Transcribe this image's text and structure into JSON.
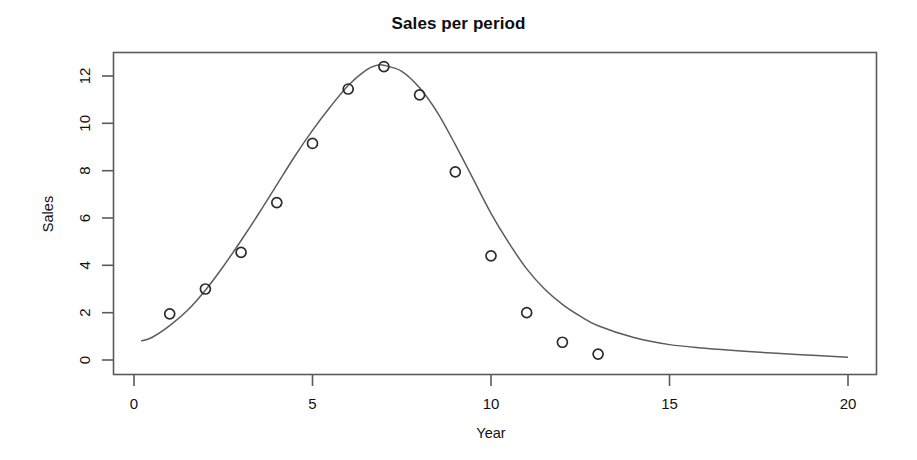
{
  "chart_data": {
    "type": "scatter",
    "title": "Sales per period",
    "xlabel": "Year",
    "ylabel": "Sales",
    "xlim": [
      0,
      20
    ],
    "ylim": [
      0,
      13
    ],
    "grid": false,
    "legend": null,
    "xticks": [
      0,
      5,
      10,
      15,
      20
    ],
    "xtick_labels": [
      "0",
      "5",
      "10",
      "15",
      "20"
    ],
    "yticks": [
      0,
      2,
      4,
      6,
      8,
      10,
      12
    ],
    "ytick_labels": [
      "0",
      "2",
      "4",
      "6",
      "8",
      "10",
      "12"
    ],
    "marker": "open-circle",
    "marker_color": "#2b2b2b",
    "line_color": "#5c5c5c",
    "axis_color": "#5a5a5a",
    "x": [
      1,
      2,
      3,
      4,
      5,
      6,
      7,
      8,
      9,
      10,
      11,
      12,
      13
    ],
    "values": [
      1.95,
      3.0,
      4.55,
      6.65,
      9.15,
      11.45,
      12.4,
      11.2,
      7.95,
      4.4,
      2.0,
      0.75,
      0.25
    ],
    "series": [
      {
        "name": "observed sales",
        "type": "scatter",
        "x": [
          1,
          2,
          3,
          4,
          5,
          6,
          7,
          8,
          9,
          10,
          11,
          12,
          13
        ],
        "values": [
          1.95,
          3.0,
          4.55,
          6.65,
          9.15,
          11.45,
          12.4,
          11.2,
          7.95,
          4.4,
          2.0,
          0.75,
          0.25
        ]
      },
      {
        "name": "fitted curve",
        "type": "line",
        "x": [
          0.2,
          0.5,
          1.0,
          1.5,
          2.0,
          2.5,
          3.0,
          3.5,
          4.0,
          4.5,
          5.0,
          5.5,
          6.0,
          6.5,
          6.8,
          7.0,
          7.5,
          8.0,
          8.5,
          9.0,
          9.5,
          10.0,
          10.5,
          11.0,
          11.5,
          12.0,
          12.5,
          13.0,
          14.0,
          15.0,
          16.0,
          17.0,
          18.0,
          19.0,
          20.0
        ],
        "values": [
          0.8,
          0.95,
          1.45,
          2.1,
          2.95,
          3.95,
          5.05,
          6.2,
          7.4,
          8.6,
          9.7,
          10.7,
          11.6,
          12.25,
          12.45,
          12.45,
          12.2,
          11.5,
          10.45,
          9.1,
          7.65,
          6.2,
          4.95,
          3.85,
          3.0,
          2.35,
          1.85,
          1.45,
          0.95,
          0.65,
          0.5,
          0.38,
          0.28,
          0.2,
          0.12
        ]
      }
    ]
  },
  "plot_geometry": {
    "left_px": 113,
    "right_px": 877,
    "top_px": 52,
    "bottom_px": 375,
    "x0_px": 134,
    "x20_px": 848,
    "y0_px": 360,
    "y12_px": 76
  }
}
